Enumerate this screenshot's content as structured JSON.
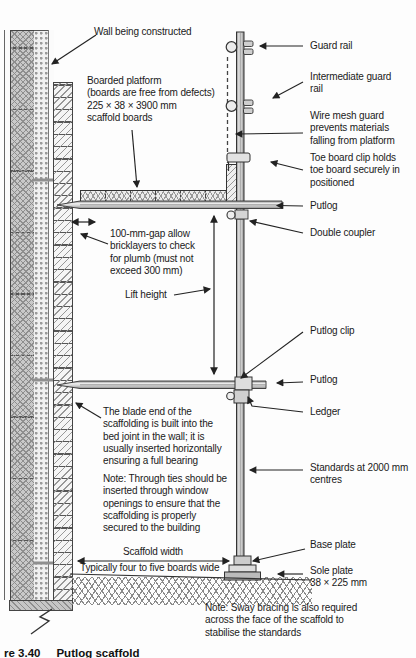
{
  "figure": {
    "caption_prefix": "re 3.40",
    "caption_title": "Putlog scaffold"
  },
  "labels_left": {
    "wall": "Wall being constructed",
    "platform": "Boarded platform\n(boards are free from defects)\n225 × 38 × 3900 mm\nscaffold boards",
    "gap": "100-mm-gap allow\nbricklayers to check\nfor plumb (must not\nexceed 300 mm)",
    "lift_height": "Lift height",
    "blade": "The blade end of the\nscaffolding is built into the\nbed joint in the wall; it is\nusually inserted horizontally\nensuring a full bearing",
    "through_ties": "Note: Through ties should be\ninserted through window\nopenings to ensure that the\nscaffolding is properly\nsecured to the building",
    "scaffold_width": "Scaffold width",
    "boards_wide": "Typically four to five boards wide"
  },
  "labels_right": {
    "guard_rail": "Guard rail",
    "intermediate_guard_rail": "Intermediate guard\nrail",
    "wire_mesh": "Wire mesh guard\nprevents materials\nfalling from platform",
    "toe_board_clip": "Toe board clip holds\ntoe board securely in\npositioned",
    "putlog_upper": "Putlog",
    "double_coupler": "Double coupler",
    "putlog_clip": "Putlog clip",
    "putlog_lower": "Putlog",
    "ledger": "Ledger",
    "standards": "Standards at 2000 mm\ncentres",
    "base_plate": "Base plate",
    "sole_plate": "Sole plate\n38 × 225 mm"
  },
  "notes": {
    "sway_bracing": "Note: Sway bracing is also required\nacross the face of the scaffold to\nstabilise the standards"
  },
  "colors": {
    "ink": "#222222",
    "paper": "#fdfdfd",
    "tube_fill": "#d8d8d8",
    "block_fill": "#c9c9c9"
  }
}
